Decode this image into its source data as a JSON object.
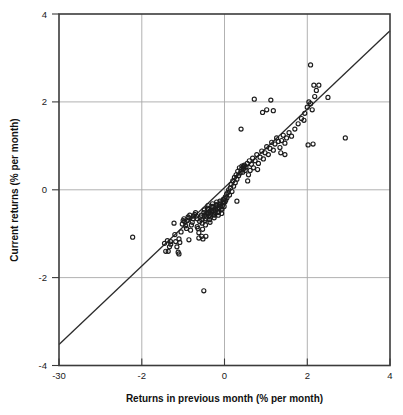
{
  "chart_data": {
    "type": "scatter",
    "title": "",
    "xlabel": "Returns in previous month (% per month)",
    "ylabel": "Current returns (% per month)",
    "xlim": [
      -4,
      4
    ],
    "ylim": [
      -4,
      4
    ],
    "xticks": [
      -4,
      -2,
      0,
      2,
      4
    ],
    "xticklabels": [
      "-30",
      "-2",
      "0",
      "2",
      "4"
    ],
    "yticks": [
      -4,
      -2,
      0,
      2,
      4
    ],
    "yticklabels": [
      "-4",
      "-2",
      "0",
      "2",
      "4"
    ],
    "grid": true,
    "grid_color": "#a9a9a9",
    "marker": "open-circle",
    "marker_color": "#1c1c1c",
    "legend": null,
    "annotations": [],
    "reference_line": {
      "name": "45-degree-identity-line",
      "type": "line",
      "x": [
        -4.0,
        4.0
      ],
      "y": [
        -3.52,
        3.62
      ],
      "color": "#2b2b2b"
    },
    "x": [
      -2.22,
      -1.45,
      -1.42,
      -1.36,
      -1.33,
      -1.3,
      -1.22,
      -1.2,
      -1.18,
      -1.15,
      -1.12,
      -1.1,
      -1.08,
      -1.05,
      -1.02,
      -1.0,
      -0.98,
      -0.96,
      -0.94,
      -0.92,
      -0.9,
      -0.88,
      -0.86,
      -0.84,
      -0.82,
      -0.8,
      -0.78,
      -0.76,
      -0.74,
      -0.72,
      -0.7,
      -0.68,
      -0.66,
      -0.64,
      -0.62,
      -0.6,
      -0.58,
      -0.56,
      -0.55,
      -0.54,
      -0.53,
      -0.52,
      -0.5,
      -0.49,
      -0.48,
      -0.47,
      -0.46,
      -0.45,
      -0.44,
      -0.43,
      -0.42,
      -0.41,
      -0.4,
      -0.39,
      -0.38,
      -0.37,
      -0.36,
      -0.35,
      -0.34,
      -0.33,
      -0.32,
      -0.31,
      -0.3,
      -0.29,
      -0.28,
      -0.27,
      -0.26,
      -0.25,
      -0.24,
      -0.23,
      -0.22,
      -0.21,
      -0.2,
      -0.19,
      -0.18,
      -0.17,
      -0.16,
      -0.15,
      -0.14,
      -0.13,
      -0.12,
      -0.11,
      -0.1,
      -0.09,
      -0.08,
      -0.07,
      -0.06,
      -0.05,
      -0.04,
      -0.03,
      -0.02,
      -0.01,
      0.0,
      0.01,
      0.02,
      0.03,
      0.05,
      0.06,
      0.08,
      0.1,
      0.12,
      0.14,
      0.16,
      0.18,
      0.2,
      0.22,
      0.24,
      0.26,
      0.28,
      0.3,
      0.32,
      0.34,
      0.36,
      0.38,
      0.4,
      0.42,
      0.44,
      0.46,
      0.48,
      0.5,
      0.52,
      0.55,
      0.58,
      0.6,
      0.62,
      0.65,
      0.68,
      0.7,
      0.74,
      0.78,
      0.82,
      0.86,
      0.9,
      0.94,
      0.98,
      1.02,
      1.06,
      1.1,
      1.14,
      1.18,
      1.22,
      1.26,
      1.3,
      1.34,
      1.38,
      1.42,
      1.46,
      1.5,
      1.56,
      1.62,
      1.7,
      1.78,
      1.86,
      1.94,
      2.0,
      2.04,
      2.08,
      2.12,
      2.18,
      2.22,
      2.28,
      2.5,
      2.92,
      1.02,
      1.12,
      0.46,
      0.56,
      -0.5,
      0.72,
      0.92,
      1.18,
      1.46,
      1.92,
      2.02,
      2.14,
      0.3,
      -0.62,
      -0.66,
      -0.55,
      -0.45,
      -1.38,
      -1.3,
      -1.1,
      -0.86,
      0.4,
      0.46,
      0.8,
      1.36,
      2.08,
      2.16
    ],
    "y": [
      -1.08,
      -1.22,
      -1.4,
      -1.4,
      -1.3,
      -1.18,
      -0.76,
      -1.02,
      -1.18,
      -1.3,
      -1.42,
      -1.46,
      -1.2,
      -0.96,
      -0.78,
      -0.7,
      -0.66,
      -0.72,
      -0.82,
      -0.88,
      -0.7,
      -0.62,
      -0.64,
      -0.58,
      -0.92,
      -0.8,
      -0.74,
      -0.66,
      -0.6,
      -0.56,
      -0.52,
      -0.6,
      -0.66,
      -0.88,
      -1.1,
      -0.72,
      -0.62,
      -0.58,
      -0.68,
      -0.76,
      -0.9,
      -1.12,
      -0.52,
      -0.46,
      -0.58,
      -0.7,
      -0.8,
      -0.66,
      -0.6,
      -0.54,
      -0.48,
      -0.42,
      -0.36,
      -0.44,
      -0.52,
      -0.6,
      -0.68,
      -0.74,
      -0.62,
      -0.56,
      -0.5,
      -0.44,
      -0.38,
      -0.32,
      -0.4,
      -0.48,
      -0.56,
      -0.64,
      -0.58,
      -0.52,
      -0.46,
      -0.4,
      -0.34,
      -0.28,
      -0.36,
      -0.44,
      -0.52,
      -0.58,
      -0.5,
      -0.42,
      -0.34,
      -0.26,
      -0.3,
      -0.38,
      -0.46,
      -0.54,
      -0.44,
      -0.36,
      -0.28,
      -0.22,
      -0.3,
      -0.38,
      -0.2,
      -0.28,
      -0.16,
      -0.24,
      -0.1,
      -0.18,
      -0.06,
      0.0,
      -0.12,
      0.04,
      0.12,
      -0.04,
      0.2,
      0.08,
      0.28,
      0.16,
      0.34,
      0.24,
      0.42,
      0.32,
      0.5,
      0.38,
      0.46,
      0.54,
      0.4,
      0.48,
      0.56,
      0.44,
      0.52,
      0.6,
      0.34,
      0.66,
      0.44,
      0.58,
      0.72,
      0.5,
      0.66,
      0.8,
      0.6,
      0.74,
      0.88,
      0.7,
      0.84,
      0.98,
      0.8,
      0.94,
      1.08,
      0.9,
      1.04,
      1.18,
      1.1,
      0.96,
      1.12,
      1.24,
      1.06,
      1.18,
      1.3,
      1.22,
      1.38,
      1.5,
      1.62,
      1.74,
      1.88,
      2.0,
      1.96,
      1.82,
      2.12,
      2.26,
      2.38,
      2.1,
      1.18,
      1.82,
      2.04,
      0.52,
      0.2,
      -2.3,
      2.06,
      1.76,
      1.8,
      0.8,
      1.58,
      1.02,
      1.04,
      -0.26,
      -0.98,
      -0.84,
      -1.06,
      -1.06,
      -1.16,
      -1.24,
      -1.12,
      -1.14,
      1.38,
      0.54,
      0.46,
      0.84,
      2.84,
      2.38
    ]
  },
  "axes": {
    "x_title": "Returns in previous month (% per month)",
    "y_title": "Current returns (% per month)"
  }
}
